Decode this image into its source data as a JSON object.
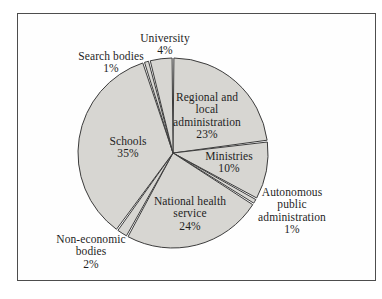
{
  "figure": {
    "description_name": "pie-chart-figure",
    "border_color": "#4d4d4d",
    "background_color": "#fefefe"
  },
  "chart_data": {
    "type": "pie",
    "title": "",
    "start_angle_deg": 0,
    "direction": "clockwise",
    "legend": "none",
    "cx": 173,
    "cy": 153,
    "r": 95,
    "gap_deg": 0.55,
    "slice_fill": "#d7d6d2",
    "slice_stroke": "#3c3c3c",
    "text_color": "#1e1e1e",
    "categories": [
      "Regional and local administration",
      "Ministries",
      "Autonomous public administration",
      "National health service",
      "Non-economic bodies",
      "Schools",
      "Search bodies",
      "University"
    ],
    "values": [
      23,
      10,
      1,
      24,
      2,
      35,
      1,
      4
    ],
    "slices": [
      {
        "name": "Regional and local administration",
        "value": 23,
        "pct_text": "23%",
        "label_text": "Regional and\nlocal\nadministration\n23%",
        "label_x": 207,
        "label_y": 91
      },
      {
        "name": "Ministries",
        "value": 10,
        "pct_text": "10%",
        "label_text": "Ministries\n10%",
        "label_x": 229,
        "label_y": 150
      },
      {
        "name": "Autonomous public administration",
        "value": 1,
        "pct_text": "1%",
        "label_text": "Autonomous\npublic\nadministration\n1%",
        "label_x": 292,
        "label_y": 186
      },
      {
        "name": "National health service",
        "value": 24,
        "pct_text": "24%",
        "label_text": "National health\nservice\n24%",
        "label_x": 190,
        "label_y": 195
      },
      {
        "name": "Non-economic bodies",
        "value": 2,
        "pct_text": "2%",
        "label_text": "Non-economic\nbodies\n2%",
        "label_x": 91,
        "label_y": 233
      },
      {
        "name": "Schools",
        "value": 35,
        "pct_text": "35%",
        "label_text": "Schools\n35%",
        "label_x": 128,
        "label_y": 135
      },
      {
        "name": "Search bodies",
        "value": 1,
        "pct_text": "1%",
        "label_text": "Search bodies\n1%",
        "label_x": 111,
        "label_y": 50
      },
      {
        "name": "University",
        "value": 4,
        "pct_text": "4%",
        "label_text": "University\n4%",
        "label_x": 165,
        "label_y": 32
      }
    ]
  }
}
